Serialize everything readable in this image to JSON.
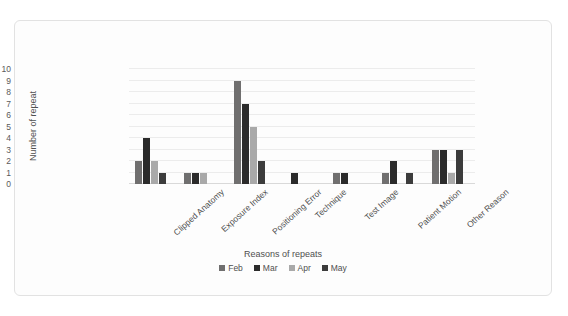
{
  "chart_data": {
    "type": "bar",
    "title": "",
    "xlabel": "Reasons of repeats",
    "ylabel": "Number of repeat",
    "ylim": [
      0,
      10
    ],
    "ytick_labels": [
      "10",
      "9",
      "8",
      "7",
      "6",
      "5",
      "4",
      "3",
      "2",
      "1",
      "0"
    ],
    "grid": true,
    "legend_position": "bottom",
    "categories": [
      "Clipped Anatomy",
      "Exposure Index",
      "Positioning Error",
      "Technique",
      "Test Image",
      "Patient Motion",
      "Other Reason"
    ],
    "series": [
      {
        "name": "Feb",
        "color": "#706f6f",
        "values": [
          2,
          1,
          9,
          0,
          1,
          1,
          3
        ]
      },
      {
        "name": "Mar",
        "color": "#2b2b2b",
        "values": [
          4,
          1,
          7,
          1,
          1,
          2,
          3
        ]
      },
      {
        "name": "Apr",
        "color": "#a9a9a9",
        "values": [
          2,
          1,
          5,
          0,
          0,
          0,
          1
        ]
      },
      {
        "name": "May",
        "color": "#3c3c3c",
        "values": [
          1,
          0,
          2,
          0,
          0,
          1,
          3
        ]
      }
    ]
  }
}
